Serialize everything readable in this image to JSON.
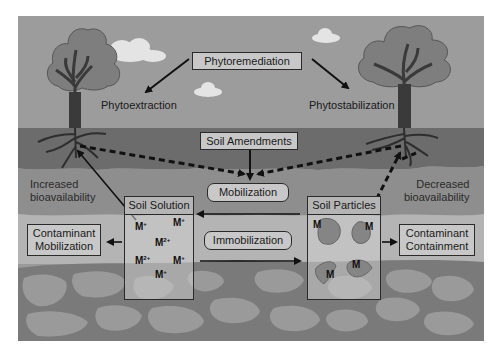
{
  "title": "Phytoremediation",
  "processes": {
    "left": "Phytoextraction",
    "right": "Phytostabilization"
  },
  "amendments": "Soil Amendments",
  "mobilization": "Mobilization",
  "immobilization": "Immobilization",
  "left_effect": {
    "line1": "Increased",
    "line2": "bioavailability"
  },
  "right_effect": {
    "line1": "Decreased",
    "line2": "bioavailability"
  },
  "soil_solution": {
    "header": "Soil Solution",
    "ions": [
      {
        "base": "M",
        "charge": "+"
      },
      {
        "base": "M",
        "charge": "+"
      },
      {
        "base": "M",
        "charge": "2+"
      },
      {
        "base": "M",
        "charge": "2+"
      },
      {
        "base": "M",
        "charge": "+"
      },
      {
        "base": "M",
        "charge": "+"
      }
    ]
  },
  "soil_particles": {
    "header": "Soil Particles",
    "labels": [
      "M",
      "M",
      "M",
      "M"
    ]
  },
  "outcomes": {
    "left": {
      "line1": "Contaminant",
      "line2": "Mobilization"
    },
    "right": {
      "line1": "Contaminant",
      "line2": "Containment"
    }
  },
  "colors": {
    "sky": "#9c9c9c",
    "cloud": "#e6e6e6",
    "tree_canopy": "#7e7e7e",
    "trunk": "#3a3a3a",
    "dark_soil": "#6c6c6c",
    "mid_soil": "#8e8e8e",
    "light_soil": "#b4b4b4",
    "rock_bed": "#7a7a7a",
    "rock": "#999999"
  }
}
